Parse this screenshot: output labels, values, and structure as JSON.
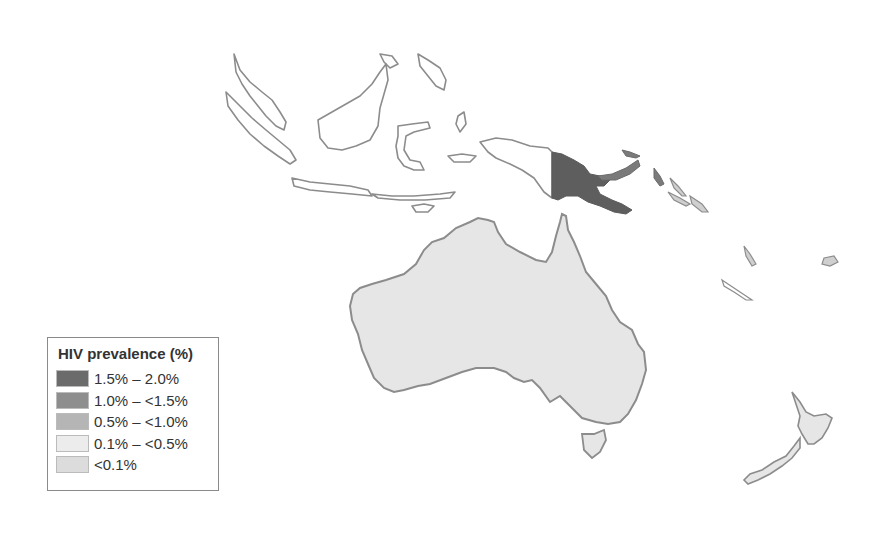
{
  "map": {
    "title": "HIV prevalence (%)",
    "region": "Oceania",
    "colors": {
      "background": "#ffffff",
      "border": "#8c8c8c",
      "land_no_data": "#ffffff",
      "lt_0_1": "#e6e6e6",
      "highlight": "#5e5e5e"
    },
    "countries": [
      {
        "name": "Papua New Guinea",
        "category": "1.5% – 2.0%",
        "fill": "#5e5e5e"
      },
      {
        "name": "Australia",
        "category": "<0.1%",
        "fill": "#e6e6e6"
      },
      {
        "name": "New Zealand",
        "category": "<0.1%",
        "fill": "#e6e6e6"
      }
    ]
  },
  "legend": {
    "title": "HIV prevalence (%)",
    "items": [
      {
        "label": "1.5% – 2.0%",
        "color": "#6b6b6b"
      },
      {
        "label": "1.0% – <1.5%",
        "color": "#8e8e8e"
      },
      {
        "label": "0.5% – <1.0%",
        "color": "#b5b5b5"
      },
      {
        "label": "0.1% – <0.5%",
        "color": "#ececec"
      },
      {
        "label": " <0.1%",
        "color": "#dcdcdc"
      }
    ]
  }
}
